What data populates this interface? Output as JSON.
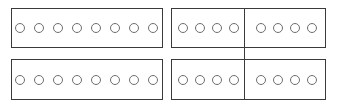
{
  "figure": {
    "title": "",
    "background_color": "#ffffff",
    "border_color": "#3a3a3a",
    "circle_stroke_color": "#6e6e6e",
    "circle_fill_color": "#ffffff",
    "canvas": {
      "width": 338,
      "height": 111
    },
    "grid": {
      "rows": 2,
      "columns": 2
    }
  },
  "panels": [
    {
      "id": "panel-top-left",
      "position": "top-left",
      "circle_count": 8,
      "has_divider": false,
      "groups": [
        {
          "count": 8
        }
      ],
      "geometry": {
        "left": 11,
        "top": 8,
        "width": 152,
        "height": 40
      }
    },
    {
      "id": "panel-top-right",
      "position": "top-right",
      "circle_count": 8,
      "has_divider": true,
      "divider_after_index": 4,
      "groups": [
        {
          "count": 4
        },
        {
          "count": 4
        }
      ],
      "geometry": {
        "left": 171,
        "top": 8,
        "width": 155,
        "height": 40
      }
    },
    {
      "id": "panel-bottom-left",
      "position": "bottom-left",
      "circle_count": 8,
      "has_divider": false,
      "groups": [
        {
          "count": 8
        }
      ],
      "geometry": {
        "left": 11,
        "top": 59,
        "width": 152,
        "height": 41
      }
    },
    {
      "id": "panel-bottom-right",
      "position": "bottom-right",
      "circle_count": 8,
      "has_divider": true,
      "divider_after_index": 4,
      "groups": [
        {
          "count": 4
        },
        {
          "count": 4
        }
      ],
      "geometry": {
        "left": 171,
        "top": 59,
        "width": 155,
        "height": 41
      }
    }
  ],
  "divider_line": {
    "id": "vertical-divider",
    "x": 244,
    "top": 8,
    "bottom": 100,
    "spans_gap_between_right_panels": true,
    "color": "#3a3a3a"
  }
}
